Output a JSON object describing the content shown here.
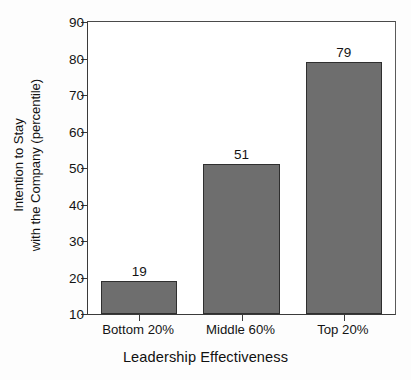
{
  "chart_data": {
    "type": "bar",
    "title": "",
    "categories": [
      "Bottom 20%",
      "Middle 60%",
      "Top 20%"
    ],
    "values": [
      19,
      51,
      79
    ],
    "value_labels": [
      "19",
      "51",
      "79"
    ],
    "xlabel": "Leadership Effectiveness",
    "ylabel_lines": [
      "Intention to Stay",
      "with the Company (percentile)"
    ],
    "ylabel": "Intention to Stay with the Company (percentile)",
    "ylim": [
      10,
      90
    ],
    "yticks": [
      10,
      20,
      30,
      40,
      50,
      60,
      70,
      80,
      90
    ],
    "ytick_labels": [
      "10",
      "20",
      "30",
      "40",
      "50",
      "60",
      "70",
      "80",
      "90"
    ],
    "grid": false,
    "legend": null,
    "bar_color": "#6e6e6e",
    "bar_edge_color": "#2f2f2f",
    "axis_color": "#3a3a3a",
    "background": "#ffffff"
  }
}
